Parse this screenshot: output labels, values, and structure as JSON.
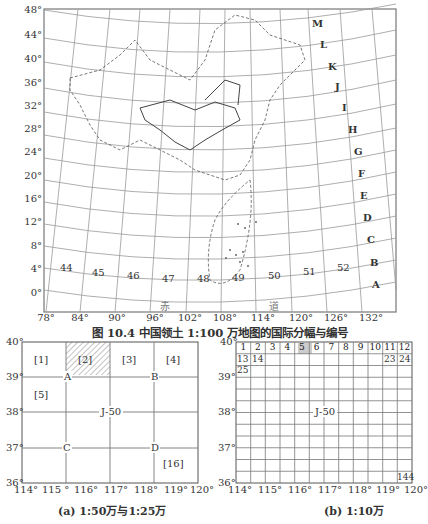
{
  "figure": {
    "caption": "图 10.4   中国领土 1:100 万地图的国际分幅与编号"
  },
  "main_map": {
    "lat_labels": [
      "48°",
      "44°",
      "40°",
      "36°",
      "32°",
      "28°",
      "24°",
      "20°",
      "16°",
      "12°",
      "8°",
      "4°",
      "0°"
    ],
    "lon_labels": [
      "78°",
      "84°",
      "90°",
      "96°",
      "102°",
      "108°",
      "114°",
      "120°",
      "126°",
      "132°"
    ],
    "column_numbers": [
      "44",
      "45",
      "46",
      "47",
      "48",
      "49",
      "50",
      "51",
      "52"
    ],
    "row_letters": [
      "M",
      "L",
      "K",
      "J",
      "I",
      "H",
      "G",
      "F",
      "E",
      "D",
      "C",
      "B",
      "A"
    ],
    "equator_label_left": "赤",
    "equator_label_right": "道"
  },
  "panel_a": {
    "caption": "(a) 1:50万与1:25万",
    "lat_labels": [
      "40°",
      "39°",
      "38°",
      "37°",
      "36°"
    ],
    "lon_labels": [
      "114°",
      "115 °",
      "116°",
      "117°",
      "118°",
      "119°",
      "120°"
    ],
    "sheet_labels": [
      "[1]",
      "[2]",
      "[3]",
      "[4]",
      "[5]",
      "[16]"
    ],
    "point_labels": [
      "A",
      "B",
      "C",
      "D"
    ],
    "center_label": "J-50"
  },
  "panel_b": {
    "caption": "(b) 1:10万",
    "lat_labels": [
      "40°",
      "39°",
      "38°",
      "37°",
      "36°"
    ],
    "lon_labels": [
      "114°",
      "115°",
      "116°",
      "117°",
      "118°",
      "119°",
      "120°"
    ],
    "top_row": [
      "1",
      "2",
      "3",
      "4",
      "5",
      "6",
      "7",
      "8",
      "9",
      "10",
      "11",
      "12"
    ],
    "second_row": [
      "13",
      "14",
      "23",
      "24"
    ],
    "third_row_first": "25",
    "last_cell": "144",
    "center_label": "J-50"
  }
}
